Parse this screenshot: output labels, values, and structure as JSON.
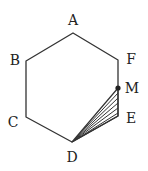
{
  "figure": {
    "type": "geometry",
    "shape": "regular hexagon",
    "stroke_color": "#333333",
    "hatch_color": "#333333",
    "vertices": [
      {
        "name": "A",
        "label": "A",
        "x": 73,
        "y": 33,
        "lx": 73,
        "ly": 20
      },
      {
        "name": "B",
        "label": "B",
        "x": 26,
        "y": 61,
        "lx": 15,
        "ly": 60
      },
      {
        "name": "C",
        "label": "C",
        "x": 26,
        "y": 117,
        "lx": 13,
        "ly": 122
      },
      {
        "name": "D",
        "label": "D",
        "x": 72,
        "y": 142,
        "lx": 72,
        "ly": 157
      },
      {
        "name": "E",
        "label": "E",
        "x": 118,
        "y": 116,
        "lx": 131,
        "ly": 118
      },
      {
        "name": "F",
        "label": "F",
        "x": 118,
        "y": 60,
        "lx": 131,
        "ly": 59
      }
    ],
    "points": [
      {
        "name": "M",
        "label": "M",
        "x": 118,
        "y": 88,
        "lx": 132,
        "ly": 88,
        "on_segment": "FE"
      }
    ],
    "shaded_region": {
      "name": "triangle DME",
      "vertices": [
        "D",
        "M",
        "E"
      ],
      "fill": "hatched"
    }
  }
}
